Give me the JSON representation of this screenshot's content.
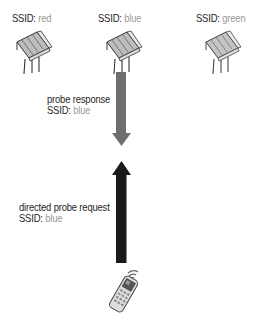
{
  "diagram": {
    "type": "wireless-probe-exchange",
    "access_points": [
      {
        "ssid_key": "SSID:",
        "ssid_value": "red",
        "value_color": "#9a9a9a"
      },
      {
        "ssid_key": "SSID:",
        "ssid_value": "blue",
        "value_color": "#9a9a9a"
      },
      {
        "ssid_key": "SSID:",
        "ssid_value": "green",
        "value_color": "#9a9a9a"
      }
    ],
    "response": {
      "title": "probe response",
      "ssid_key": "SSID:",
      "ssid_value": "blue",
      "arrow_direction": "down",
      "arrow_color": "#6e6e6e"
    },
    "request": {
      "title": "directed probe request",
      "ssid_key": "SSID:",
      "ssid_value": "blue",
      "arrow_direction": "up",
      "arrow_color": "#1a1a1a"
    },
    "client": {
      "icon": "wireless-handheld-device-icon"
    }
  }
}
